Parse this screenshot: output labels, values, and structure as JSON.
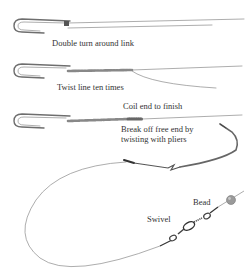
{
  "diagram": {
    "top_caption_faint": "",
    "steps": [
      {
        "id": "step-1",
        "label": "Double turn around link"
      },
      {
        "id": "step-2",
        "label": "Twist line ten times"
      },
      {
        "id": "step-3",
        "label": "Coil end to finish"
      },
      {
        "id": "step-4",
        "label": "Break off free end by twisting with pliers",
        "lines": [
          "Break off free end by",
          "twisting with pliers"
        ]
      }
    ],
    "rig_labels": {
      "swivel": "Swivel",
      "bead": "Bead"
    },
    "colors": {
      "wire": "#8a8a8a",
      "ink": "#333333",
      "bead": "#9a9a9a"
    }
  }
}
